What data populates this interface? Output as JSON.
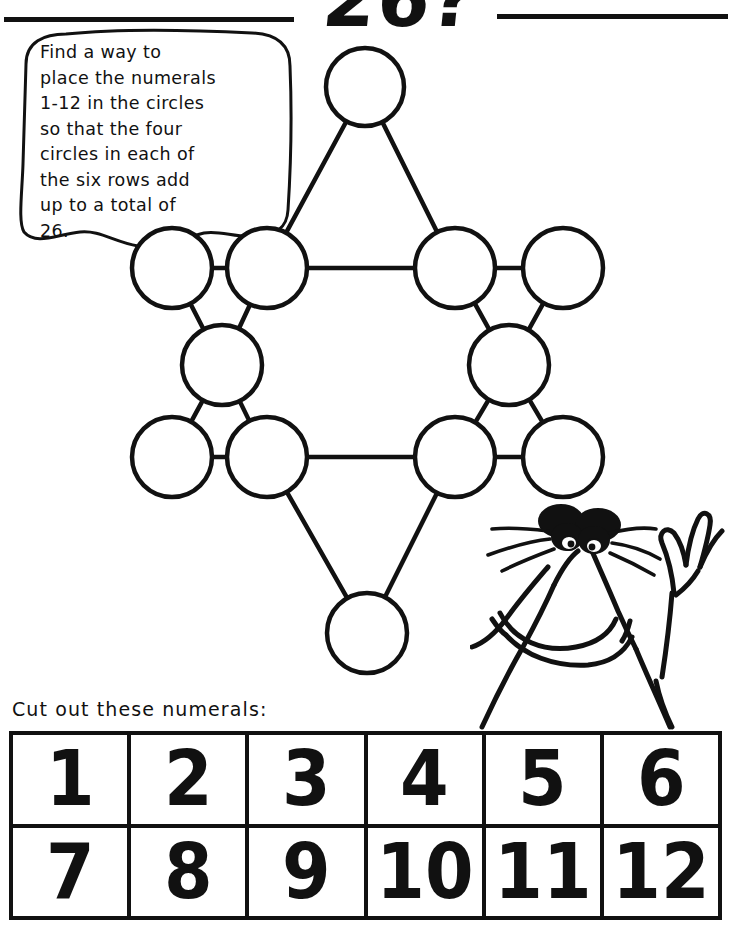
{
  "page": {
    "title": "26?",
    "background_color": "#ffffff",
    "ink_color": "#111111"
  },
  "header": {
    "title": "26?",
    "rule_left": "horizontal-rule",
    "rule_right": "horizontal-rule"
  },
  "instructions": {
    "bubble_text": "Find a way to\nplace the numerals\n1-12 in the circles\nso that the four\ncircles in each of\nthe six rows add\nup to a total of\n26."
  },
  "puzzle": {
    "type": "magic-star-hexagram",
    "target_sum": 26,
    "numeral_range": "1-12",
    "circle_count": 12,
    "rows_count": 6,
    "circles_per_row": 4,
    "circles": [
      {
        "id": "top",
        "cx": 365,
        "cy": 87,
        "r": 39,
        "value": ""
      },
      {
        "id": "upper-left-outer",
        "cx": 172,
        "cy": 268,
        "r": 40,
        "value": ""
      },
      {
        "id": "upper-left-inner",
        "cx": 267,
        "cy": 268,
        "r": 40,
        "value": ""
      },
      {
        "id": "upper-right-inner",
        "cx": 455,
        "cy": 268,
        "r": 40,
        "value": ""
      },
      {
        "id": "upper-right-outer",
        "cx": 563,
        "cy": 268,
        "r": 40,
        "value": ""
      },
      {
        "id": "middle-left",
        "cx": 222,
        "cy": 365,
        "r": 40,
        "value": ""
      },
      {
        "id": "middle-right",
        "cx": 509,
        "cy": 365,
        "r": 40,
        "value": ""
      },
      {
        "id": "lower-left-outer",
        "cx": 172,
        "cy": 457,
        "r": 40,
        "value": ""
      },
      {
        "id": "lower-left-inner",
        "cx": 267,
        "cy": 457,
        "r": 40,
        "value": ""
      },
      {
        "id": "lower-right-inner",
        "cx": 455,
        "cy": 457,
        "r": 40,
        "value": ""
      },
      {
        "id": "lower-right-outer",
        "cx": 563,
        "cy": 457,
        "r": 40,
        "value": ""
      },
      {
        "id": "bottom",
        "cx": 367,
        "cy": 633,
        "r": 40,
        "value": ""
      }
    ],
    "edges": [
      {
        "from": "top",
        "to": "upper-left-inner"
      },
      {
        "from": "top",
        "to": "upper-right-inner"
      },
      {
        "from": "upper-left-inner",
        "to": "upper-right-inner"
      },
      {
        "from": "upper-left-outer",
        "to": "upper-left-inner"
      },
      {
        "from": "upper-right-inner",
        "to": "upper-right-outer"
      },
      {
        "from": "upper-left-outer",
        "to": "middle-left"
      },
      {
        "from": "upper-left-inner",
        "to": "middle-left"
      },
      {
        "from": "upper-right-inner",
        "to": "middle-right"
      },
      {
        "from": "upper-right-outer",
        "to": "middle-right"
      },
      {
        "from": "middle-left",
        "to": "lower-left-outer"
      },
      {
        "from": "middle-left",
        "to": "lower-left-inner"
      },
      {
        "from": "middle-right",
        "to": "lower-right-inner"
      },
      {
        "from": "middle-right",
        "to": "lower-right-outer"
      },
      {
        "from": "lower-left-outer",
        "to": "lower-left-inner"
      },
      {
        "from": "lower-right-inner",
        "to": "lower-right-outer"
      },
      {
        "from": "lower-left-inner",
        "to": "lower-right-inner"
      },
      {
        "from": "lower-left-inner",
        "to": "bottom"
      },
      {
        "from": "lower-right-inner",
        "to": "bottom"
      }
    ]
  },
  "character": {
    "name": "cartoon-creature",
    "description": "hand-drawn creature with thick black eyebrows, whiskers, large snout, wide smile and a raised waving hand"
  },
  "cutout": {
    "label": "Cut out these numerals:",
    "rows": [
      [
        "1",
        "2",
        "3",
        "4",
        "5",
        "6"
      ],
      [
        "7",
        "8",
        "9",
        "10",
        "11",
        "12"
      ]
    ]
  }
}
